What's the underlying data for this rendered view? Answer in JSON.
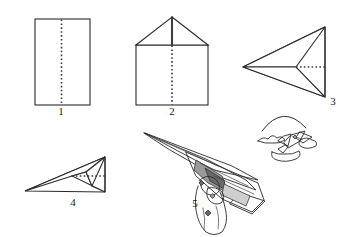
{
  "document": {
    "title": "Paper Airplane Folding Instructions",
    "subject": "origami-paper-dart-five-steps",
    "background_color": "#ffffff",
    "ink_color": "#2b2b2b"
  },
  "steps": [
    {
      "number": "1",
      "name": "rectangular-sheet-with-center-crease",
      "description": "Flat rectangular sheet of paper with a vertical dotted center fold line",
      "label_x": 61,
      "label_y": 115
    },
    {
      "number": "2",
      "name": "top-corners-folded-to-center",
      "description": "Square with triangular roof: top two corners folded in to the center line",
      "label_x": 172,
      "label_y": 115
    },
    {
      "number": "3",
      "name": "upper-edges-folded-to-center-dart",
      "description": "Left-pointing dart shape with horizontal dotted fold line through the middle",
      "label_x": 333,
      "label_y": 105
    },
    {
      "number": "4",
      "name": "folded-in-half-lengthwise",
      "description": "Flattened dart folded along its length, horizontal dotted wing crease",
      "label_x": 73,
      "label_y": 206
    },
    {
      "number": "5",
      "name": "finished-plane-held-in-hand",
      "description": "Completed paper airplane gripped by a hand, ready to throw",
      "label_x": 195,
      "label_y": 207
    }
  ],
  "flight_illustration": {
    "name": "plane-in-flight",
    "description": "Small paper airplane flying away with a curved trajectory arc above it",
    "arc_description": "curved flight-path arc",
    "cloud_description": "sketchy motion and cloud strokes around the flying plane"
  },
  "colors": {
    "ink": "#2b2b2b",
    "crease": "#3a3a3a",
    "shade_light": "#cfcfcf",
    "shade_mid": "#9a9a9a",
    "shade_dark": "#6a6a6a",
    "paper": "#ffffff"
  }
}
